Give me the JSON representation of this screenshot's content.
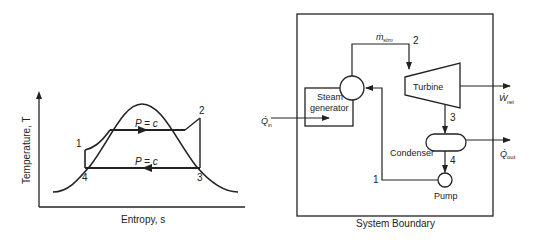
{
  "ts_diagram": {
    "ylabel": "Temperature, T",
    "xlabel": "Entropy, s",
    "upper_process_label": "P = c",
    "lower_process_label": "P = c",
    "state_points": [
      "1",
      "2",
      "3",
      "4"
    ]
  },
  "system_diagram": {
    "boundary_label": "System Boundary",
    "components": {
      "steam_generator": "Steam generator",
      "steam_generator_line1": "Steam",
      "steam_generator_line2": "generator",
      "turbine": "Turbine",
      "condenser": "Condenser",
      "pump": "Pump"
    },
    "flow_labels": {
      "mass_flow": "ṁ",
      "mass_flow_sub": "stm",
      "heat_in": "Q̇",
      "heat_in_sub": "in",
      "work_net": "Ẇ",
      "work_net_sub": "net",
      "heat_out": "Q̇",
      "heat_out_sub": "out"
    },
    "state_points": [
      "1",
      "2",
      "3",
      "4"
    ]
  },
  "colors": {
    "line": "#222222",
    "background": "#ffffff"
  }
}
